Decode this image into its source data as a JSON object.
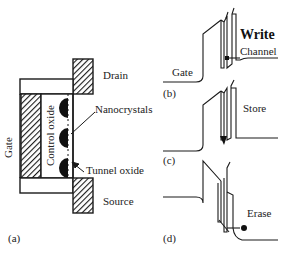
{
  "figure": {
    "panel_a": {
      "panel_label": "(a)",
      "labels": {
        "drain": "Drain",
        "source": "Source",
        "gate": "Gate",
        "control_oxide": "Control oxide",
        "nanocrystals": "Nanocrystals",
        "tunnel_oxide": "Tunnel oxide"
      }
    },
    "panel_b": {
      "panel_label": "(b)",
      "title": "Write",
      "labels": {
        "gate": "Gate",
        "channel": "Channel"
      }
    },
    "panel_c": {
      "panel_label": "(c)",
      "title": "Store"
    },
    "panel_d": {
      "panel_label": "(d)",
      "title": "Erase"
    },
    "colors": {
      "line": "#1a1a1a",
      "fill": "#ffffff",
      "hatch": "#1a1a1a"
    }
  }
}
